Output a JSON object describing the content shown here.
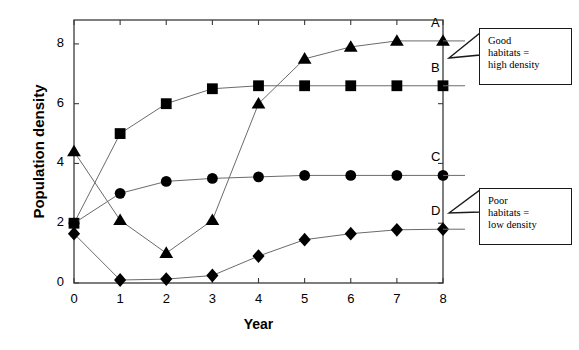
{
  "chart_data": {
    "type": "line",
    "title": "",
    "xlabel": "Year",
    "ylabel": "Population density",
    "xlim": [
      0,
      8
    ],
    "ylim": [
      0,
      8.8
    ],
    "xticks": [
      0,
      1,
      2,
      3,
      4,
      5,
      6,
      7,
      8
    ],
    "yticks": [
      0,
      2,
      4,
      6,
      8
    ],
    "xtick_labels": [
      "0",
      "1",
      "2",
      "3",
      "4",
      "5",
      "6",
      "7",
      "8"
    ],
    "ytick_labels": [
      "0",
      "2",
      "4",
      "6",
      "8"
    ],
    "grid": false,
    "legend_position": "inline-right-of-last-point",
    "x": [
      0,
      1,
      2,
      3,
      4,
      5,
      6,
      7,
      8
    ],
    "series": [
      {
        "name": "A",
        "marker": "triangle",
        "color": "#000000",
        "values": [
          4.4,
          2.1,
          1.0,
          2.1,
          6.0,
          7.5,
          7.9,
          8.1,
          8.1
        ]
      },
      {
        "name": "B",
        "marker": "square",
        "color": "#000000",
        "values": [
          2.0,
          5.0,
          6.0,
          6.5,
          6.6,
          6.6,
          6.6,
          6.6,
          6.6
        ]
      },
      {
        "name": "C",
        "marker": "circle",
        "color": "#000000",
        "values": [
          2.0,
          3.0,
          3.4,
          3.5,
          3.55,
          3.6,
          3.6,
          3.6,
          3.6
        ]
      },
      {
        "name": "D",
        "marker": "diamond",
        "color": "#000000",
        "values": [
          1.65,
          0.1,
          0.13,
          0.25,
          0.9,
          1.45,
          1.65,
          1.78,
          1.8
        ]
      }
    ],
    "annotations": [
      {
        "id": "good-habitats",
        "lines": [
          "Good",
          "habitats =",
          "high density"
        ],
        "text": "Good habitats = high density",
        "points_to": "A"
      },
      {
        "id": "poor-habitats",
        "lines": [
          "Poor",
          "habitats =",
          "low density"
        ],
        "text": "Poor habitats = low density",
        "points_to": "D"
      }
    ]
  },
  "axis": {
    "y_title": "Population density",
    "x_title": "Year"
  },
  "annotations": {
    "good": {
      "line1": "Good",
      "line2": "habitats =",
      "line3": "high density"
    },
    "poor": {
      "line1": "Poor",
      "line2": "habitats =",
      "line3": "low density"
    }
  }
}
